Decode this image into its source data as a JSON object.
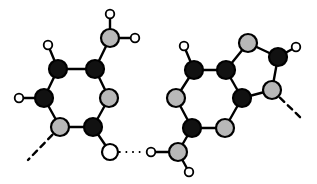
{
  "figure": {
    "background_color": "#ffffff",
    "width": 317,
    "height": 184
  },
  "style": {
    "atom_colors": {
      "dark": "#111111",
      "gray": "#b8b8b8",
      "white": "#ffffff"
    },
    "outline_color": "#000000",
    "bond_color": "#000000",
    "bond_width": 2.4,
    "hbond_width": 2.2,
    "hbond_dash": "1.6 5.0",
    "dangling_dash": "6 5",
    "radii": {
      "large": 9.0,
      "medium": 8.2,
      "hydroxyl": 8.0,
      "hydrogen": 4.3
    }
  },
  "chart_data": {
    "type": "diagram",
    "subunits": [
      {
        "name": "left-molecule",
        "ring_type": "six-membered",
        "atoms": [
          {
            "id": "L1",
            "x": 58,
            "y": 69,
            "fill": "dark",
            "r": "large"
          },
          {
            "id": "L2",
            "x": 95,
            "y": 69,
            "fill": "dark",
            "r": "large"
          },
          {
            "id": "L3",
            "x": 109,
            "y": 98,
            "fill": "gray",
            "r": "large"
          },
          {
            "id": "L4",
            "x": 93,
            "y": 127,
            "fill": "dark",
            "r": "large"
          },
          {
            "id": "L5",
            "x": 60,
            "y": 127,
            "fill": "gray",
            "r": "large"
          },
          {
            "id": "L6",
            "x": 44,
            "y": 98,
            "fill": "dark",
            "r": "large"
          },
          {
            "id": "LC",
            "x": 110,
            "y": 38,
            "fill": "gray",
            "r": "large"
          },
          {
            "id": "LO",
            "x": 110,
            "y": 152,
            "fill": "white",
            "r": "hydroxyl"
          },
          {
            "id": "LH1",
            "x": 48,
            "y": 45,
            "fill": "white",
            "r": "hydrogen"
          },
          {
            "id": "LH2",
            "x": 19,
            "y": 98,
            "fill": "white",
            "r": "hydrogen"
          },
          {
            "id": "LH3",
            "x": 110,
            "y": 14,
            "fill": "white",
            "r": "hydrogen"
          },
          {
            "id": "LH4",
            "x": 135,
            "y": 38,
            "fill": "white",
            "r": "hydrogen"
          }
        ],
        "bonds": [
          {
            "from": "L1",
            "to": "L2"
          },
          {
            "from": "L2",
            "to": "L3"
          },
          {
            "from": "L3",
            "to": "L4"
          },
          {
            "from": "L4",
            "to": "L5"
          },
          {
            "from": "L5",
            "to": "L6"
          },
          {
            "from": "L6",
            "to": "L1"
          },
          {
            "from": "L2",
            "to": "LC"
          },
          {
            "from": "LC",
            "to": "LH3"
          },
          {
            "from": "LC",
            "to": "LH4"
          },
          {
            "from": "L1",
            "to": "LH1"
          },
          {
            "from": "L6",
            "to": "LH2"
          },
          {
            "from": "L4",
            "to": "LO"
          }
        ],
        "dangling_bonds": [
          {
            "from": "L5",
            "x2": 28,
            "y2": 160
          }
        ]
      },
      {
        "name": "right-molecule",
        "ring_type": "fused bicyclic (six + five)",
        "atoms": [
          {
            "id": "R1",
            "x": 194,
            "y": 70,
            "fill": "dark",
            "r": "large"
          },
          {
            "id": "R2",
            "x": 226,
            "y": 70,
            "fill": "dark",
            "r": "large"
          },
          {
            "id": "R3",
            "x": 242,
            "y": 98,
            "fill": "dark",
            "r": "large"
          },
          {
            "id": "R4",
            "x": 225,
            "y": 128,
            "fill": "gray",
            "r": "large"
          },
          {
            "id": "R5",
            "x": 192,
            "y": 128,
            "fill": "dark",
            "r": "large"
          },
          {
            "id": "R6",
            "x": 176,
            "y": 98,
            "fill": "gray",
            "r": "large"
          },
          {
            "id": "R7",
            "x": 248,
            "y": 43,
            "fill": "gray",
            "r": "large"
          },
          {
            "id": "R8",
            "x": 278,
            "y": 57,
            "fill": "dark",
            "r": "large"
          },
          {
            "id": "R9",
            "x": 272,
            "y": 90,
            "fill": "gray",
            "r": "large"
          },
          {
            "id": "RC",
            "x": 178,
            "y": 152,
            "fill": "gray",
            "r": "large"
          },
          {
            "id": "RO",
            "x": 151,
            "y": 152,
            "fill": "white",
            "r": "hydrogen"
          },
          {
            "id": "RH1",
            "x": 184,
            "y": 46,
            "fill": "white",
            "r": "hydrogen"
          },
          {
            "id": "RH2",
            "x": 296,
            "y": 47,
            "fill": "white",
            "r": "hydrogen"
          },
          {
            "id": "RH3",
            "x": 189,
            "y": 172,
            "fill": "white",
            "r": "hydrogen"
          }
        ],
        "bonds": [
          {
            "from": "R1",
            "to": "R2"
          },
          {
            "from": "R2",
            "to": "R3"
          },
          {
            "from": "R3",
            "to": "R4"
          },
          {
            "from": "R4",
            "to": "R5"
          },
          {
            "from": "R5",
            "to": "R6"
          },
          {
            "from": "R6",
            "to": "R1"
          },
          {
            "from": "R2",
            "to": "R7"
          },
          {
            "from": "R7",
            "to": "R8"
          },
          {
            "from": "R8",
            "to": "R9"
          },
          {
            "from": "R9",
            "to": "R3"
          },
          {
            "from": "R1",
            "to": "RH1"
          },
          {
            "from": "R8",
            "to": "RH2"
          },
          {
            "from": "R5",
            "to": "RC"
          },
          {
            "from": "RC",
            "to": "RO"
          },
          {
            "from": "RC",
            "to": "RH3"
          }
        ],
        "dangling_bonds": [
          {
            "from": "R9",
            "x2": 303,
            "y2": 120
          }
        ]
      }
    ],
    "hydrogen_bonds": [
      {
        "name": "central-hydrogen-bond",
        "from": "LO",
        "to": "RO",
        "x1": 119,
        "y1": 152,
        "x2": 145,
        "y2": 152,
        "style": "dotted"
      }
    ],
    "legend": {
      "dark_atom": "dark-filled atom",
      "gray_atom": "gray-filled atom",
      "small_white_atom": "hydrogen",
      "large_white_atom": "hydroxyl oxygen",
      "dotted_line": "hydrogen bond",
      "dashed_line": "bond to rest of structure"
    }
  }
}
